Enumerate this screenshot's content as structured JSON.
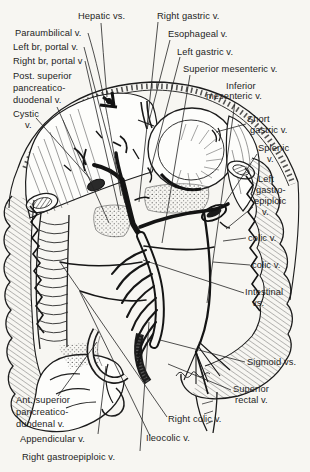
{
  "figure": {
    "type": "anatomical line drawing",
    "ink_color": "#1c1c1c",
    "paper_color": "#f7f6f2"
  },
  "labels": {
    "hepatic_veins": {
      "text": "Hepatic vs."
    },
    "paraumbilical": {
      "text": "Paraumbilical v."
    },
    "left_branch_portal": {
      "text": "Left br, portal v."
    },
    "right_branch_portal": {
      "text": "Right br, portal v"
    },
    "post_superior_pancreaticoduodenal": {
      "line1": "Post. superior",
      "line2": "pancreatico-",
      "line3": "duodenal v."
    },
    "cystic": {
      "line1": "Cystic",
      "line2": "v."
    },
    "right_gastric": {
      "text": "Right gastric v."
    },
    "esophageal": {
      "text": "Esophageal v."
    },
    "left_gastric": {
      "text": "Left gastric v."
    },
    "superior_mesenteric": {
      "text": "Superior mesenteric v."
    },
    "inferior_mesenteric": {
      "line1": "Inferior",
      "line2": "mesenteric v."
    },
    "short_gastric": {
      "line1": "Short",
      "line2": "gastric v."
    },
    "splenic": {
      "line1": "Splenic",
      "line2": "v."
    },
    "left_gastroepiploic": {
      "line1": "Left",
      "line2": "gastro-",
      "line3": "epiploic",
      "line4": "v."
    },
    "colic_upper": {
      "text": "colic v."
    },
    "colic_lower": {
      "text": "colic v."
    },
    "intestinal": {
      "line1": "Intestinal",
      "line2": "vs."
    },
    "sigmoid": {
      "text": "Sigmoid vs."
    },
    "superior_rectal": {
      "line1": "Superior",
      "line2": "rectal v."
    },
    "right_colic": {
      "text": "Right colic v."
    },
    "ileocolic": {
      "text": "Ileocolic v."
    },
    "ant_superior_pancreaticoduodenal": {
      "line1": "Ant. superior",
      "line2": "pancreatico-",
      "line3": "duodenal v."
    },
    "appendicular": {
      "text": "Appendicular v."
    },
    "right_gastroepiploic": {
      "text": "Right gastroepiploic v."
    }
  }
}
